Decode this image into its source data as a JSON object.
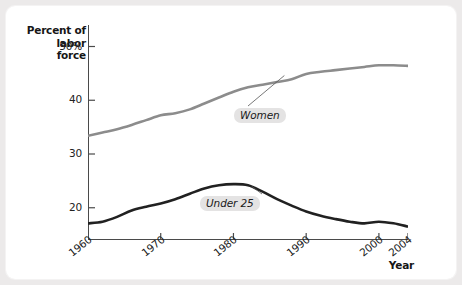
{
  "chart_data": {
    "type": "line",
    "title": "",
    "xlabel": "Year",
    "ylabel": "Percent of labor force",
    "ylabel_line1": "Percent of",
    "ylabel_line2": "labor force",
    "xlim": [
      1960,
      2004
    ],
    "ylim": [
      14,
      54
    ],
    "y_axis_break": true,
    "grid": false,
    "legend_position": "inline-annotation",
    "ytick_labels": [
      "50%",
      "40",
      "30",
      "20"
    ],
    "ytick_values": [
      50,
      40,
      30,
      20
    ],
    "xtick_labels": [
      "1960",
      "1970",
      "1980",
      "1990",
      "2000",
      "2004"
    ],
    "xtick_values": [
      1960,
      1970,
      1980,
      1990,
      2000,
      2004
    ],
    "series": [
      {
        "name": "Women",
        "color": "#8c8c8c",
        "label_text": "Women",
        "x": [
          1960,
          1962,
          1964,
          1966,
          1968,
          1970,
          1972,
          1974,
          1976,
          1978,
          1980,
          1982,
          1984,
          1986,
          1988,
          1990,
          1992,
          1994,
          1996,
          1998,
          2000,
          2002,
          2004
        ],
        "values": [
          33.4,
          34.0,
          34.6,
          35.4,
          36.3,
          37.2,
          37.6,
          38.3,
          39.4,
          40.5,
          41.6,
          42.4,
          42.9,
          43.4,
          43.9,
          44.9,
          45.3,
          45.6,
          45.9,
          46.2,
          46.5,
          46.5,
          46.4
        ]
      },
      {
        "name": "Under 25",
        "color": "#212121",
        "label_text": "Under 25",
        "x": [
          1960,
          1962,
          1964,
          1966,
          1968,
          1970,
          1972,
          1974,
          1976,
          1978,
          1980,
          1982,
          1984,
          1986,
          1988,
          1990,
          1992,
          1994,
          1996,
          1998,
          2000,
          2002,
          2004
        ],
        "values": [
          17.1,
          17.4,
          18.3,
          19.5,
          20.2,
          20.8,
          21.6,
          22.6,
          23.6,
          24.2,
          24.4,
          24.2,
          23.0,
          21.6,
          20.4,
          19.3,
          18.5,
          17.9,
          17.4,
          17.1,
          17.4,
          17.1,
          16.5
        ]
      }
    ],
    "annotations": [
      {
        "text": "Women",
        "attach_year": 1987,
        "attach_value": 44.6
      },
      {
        "text": "Under 25",
        "attach_year": 1982.5,
        "attach_value": 24.0
      }
    ]
  }
}
